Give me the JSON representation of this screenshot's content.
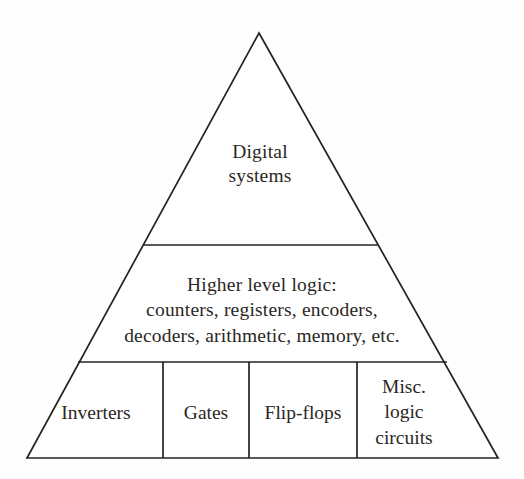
{
  "diagram": {
    "type": "pyramid",
    "background_color": "#fefefe",
    "stroke_color": "#262220",
    "text_color": "#2b2724",
    "geometry": {
      "apex": [
        259,
        33
      ],
      "bottom_left": [
        27,
        458
      ],
      "bottom_right": [
        498,
        458
      ],
      "divider_1_y": 245,
      "divider_2_y": 362,
      "vertical_dividers_x": [
        163,
        249,
        357
      ]
    },
    "levels": [
      {
        "name": "top",
        "label": "Digital\nsystems",
        "lines": [
          "Digital",
          "systems"
        ]
      },
      {
        "name": "middle",
        "label": "Higher level logic:\ncounters, registers, encoders,\ndecoders, arithmetic, memory, etc.",
        "lines": [
          "Higher level logic:",
          "counters, registers, encoders,",
          "decoders, arithmetic, memory, etc."
        ]
      },
      {
        "name": "bottom",
        "cells": [
          {
            "name": "inverters",
            "label": "Inverters",
            "lines": [
              "Inverters"
            ]
          },
          {
            "name": "gates",
            "label": "Gates",
            "lines": [
              "Gates"
            ]
          },
          {
            "name": "flip-flops",
            "label": "Flip-flops",
            "lines": [
              "Flip-flops"
            ]
          },
          {
            "name": "misc",
            "label": "Misc.\nlogic\ncircuits",
            "lines": [
              "Misc.",
              "logic",
              "circuits"
            ]
          }
        ]
      }
    ]
  }
}
